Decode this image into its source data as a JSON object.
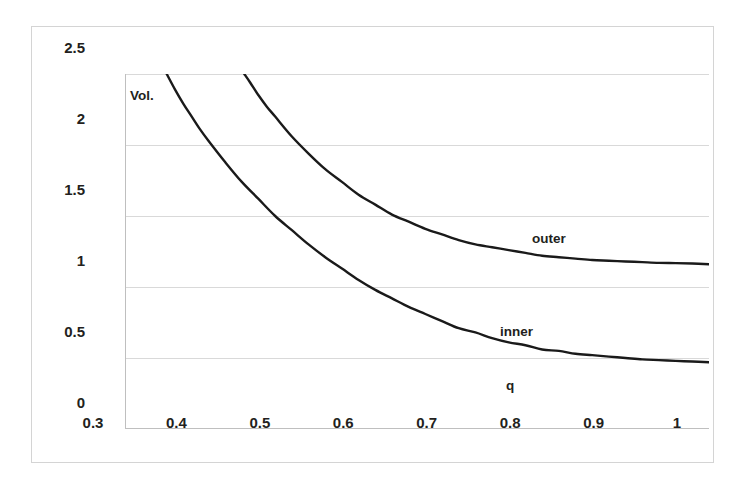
{
  "chart_data": {
    "type": "line",
    "title": "",
    "subtitle": "",
    "xlabel": "q",
    "ylabel": "Vol.",
    "xlim": [
      0.3,
      1.0
    ],
    "ylim": [
      0,
      2.5
    ],
    "grid": true,
    "grid_axis": "y",
    "legend": "inline-annotations",
    "x_ticks": [
      "0.3",
      "0.4",
      "0.5",
      "0.6",
      "0.7",
      "0.8",
      "0.9",
      "1"
    ],
    "x_tick_values": [
      0.3,
      0.4,
      0.5,
      0.6,
      0.7,
      0.8,
      0.9,
      1.0
    ],
    "y_ticks": [
      "0",
      "0.5",
      "1",
      "1.5",
      "2",
      "2.5"
    ],
    "y_tick_values": [
      0,
      0.5,
      1.0,
      1.5,
      2.0,
      2.5
    ],
    "line_color": "#1a1a1a",
    "grid_color": "#d9d9d9",
    "axis_color": "#bfbfbf",
    "background": "#ffffff",
    "annotations": [
      {
        "text": "Vol.",
        "x": 0.306,
        "y": 2.4,
        "role": "y-axis-title"
      },
      {
        "text": "outer",
        "x": 0.79,
        "y": 1.42,
        "role": "series-label"
      },
      {
        "text": "inner",
        "x": 0.752,
        "y": 0.79,
        "role": "series-label"
      },
      {
        "text": "q",
        "x": 0.759,
        "y": 0.4,
        "role": "x-axis-title"
      }
    ],
    "series": [
      {
        "name": "inner",
        "x": [
          0.35,
          0.36,
          0.37,
          0.38,
          0.39,
          0.4,
          0.42,
          0.44,
          0.46,
          0.48,
          0.5,
          0.52,
          0.54,
          0.56,
          0.58,
          0.6,
          0.62,
          0.64,
          0.66,
          0.68,
          0.7,
          0.72,
          0.74,
          0.76,
          0.78,
          0.8,
          0.82,
          0.84,
          0.86,
          0.88,
          0.9,
          0.92,
          0.94,
          0.96,
          0.98,
          1.0
        ],
        "values": [
          2.5,
          2.39,
          2.29,
          2.2,
          2.11,
          2.03,
          1.88,
          1.74,
          1.62,
          1.5,
          1.4,
          1.3,
          1.21,
          1.13,
          1.05,
          0.98,
          0.92,
          0.86,
          0.81,
          0.76,
          0.71,
          0.68,
          0.64,
          0.61,
          0.59,
          0.56,
          0.55,
          0.53,
          0.52,
          0.51,
          0.5,
          0.49,
          0.485,
          0.48,
          0.475,
          0.47
        ],
        "asymptote": 0.47
      },
      {
        "name": "outer",
        "x": [
          0.443,
          0.45,
          0.46,
          0.47,
          0.48,
          0.5,
          0.52,
          0.54,
          0.56,
          0.58,
          0.6,
          0.62,
          0.64,
          0.66,
          0.68,
          0.7,
          0.72,
          0.74,
          0.76,
          0.78,
          0.8,
          0.82,
          0.84,
          0.86,
          0.88,
          0.9,
          0.92,
          0.94,
          0.96,
          0.98,
          1.0
        ],
        "values": [
          2.5,
          2.44,
          2.35,
          2.27,
          2.2,
          2.06,
          1.94,
          1.83,
          1.74,
          1.65,
          1.58,
          1.51,
          1.46,
          1.41,
          1.37,
          1.33,
          1.3,
          1.28,
          1.26,
          1.24,
          1.22,
          1.21,
          1.2,
          1.19,
          1.185,
          1.18,
          1.175,
          1.17,
          1.168,
          1.165,
          1.16
        ],
        "asymptote": 1.16
      }
    ]
  }
}
